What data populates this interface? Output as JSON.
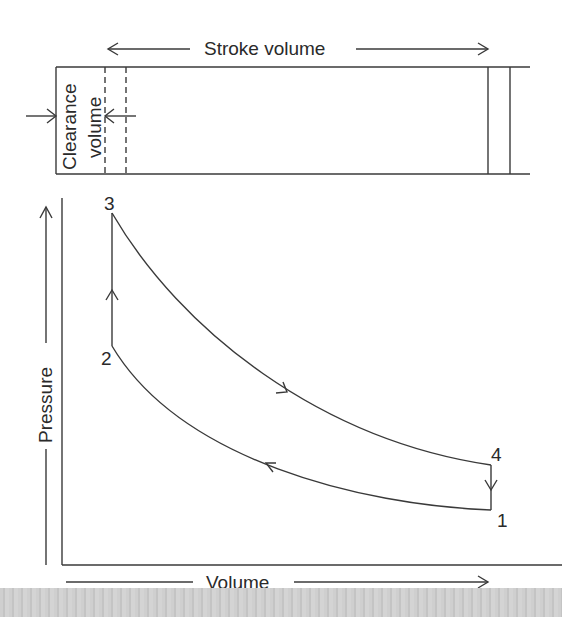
{
  "figure": {
    "type": "pv-diagram-with-cylinder",
    "cylinder": {
      "stroke_label": "Stroke volume",
      "clearance_label_line1": "Clearance",
      "clearance_label_line2": "volume"
    },
    "axes": {
      "ylabel": "Pressure",
      "xlabel": "Volume"
    },
    "points": [
      {
        "id": "1",
        "label": "1"
      },
      {
        "id": "2",
        "label": "2"
      },
      {
        "id": "3",
        "label": "3"
      },
      {
        "id": "4",
        "label": "4"
      }
    ],
    "processes": [
      {
        "from": "1",
        "to": "2",
        "shape": "curve",
        "direction": "leftward"
      },
      {
        "from": "2",
        "to": "3",
        "shape": "vertical line",
        "direction": "upward"
      },
      {
        "from": "3",
        "to": "4",
        "shape": "curve",
        "direction": "rightward"
      },
      {
        "from": "4",
        "to": "1",
        "shape": "vertical line",
        "direction": "downward"
      }
    ],
    "colors": {
      "line": "#3a3a3a",
      "background": "#ffffff",
      "strip": "#cccccc"
    }
  }
}
